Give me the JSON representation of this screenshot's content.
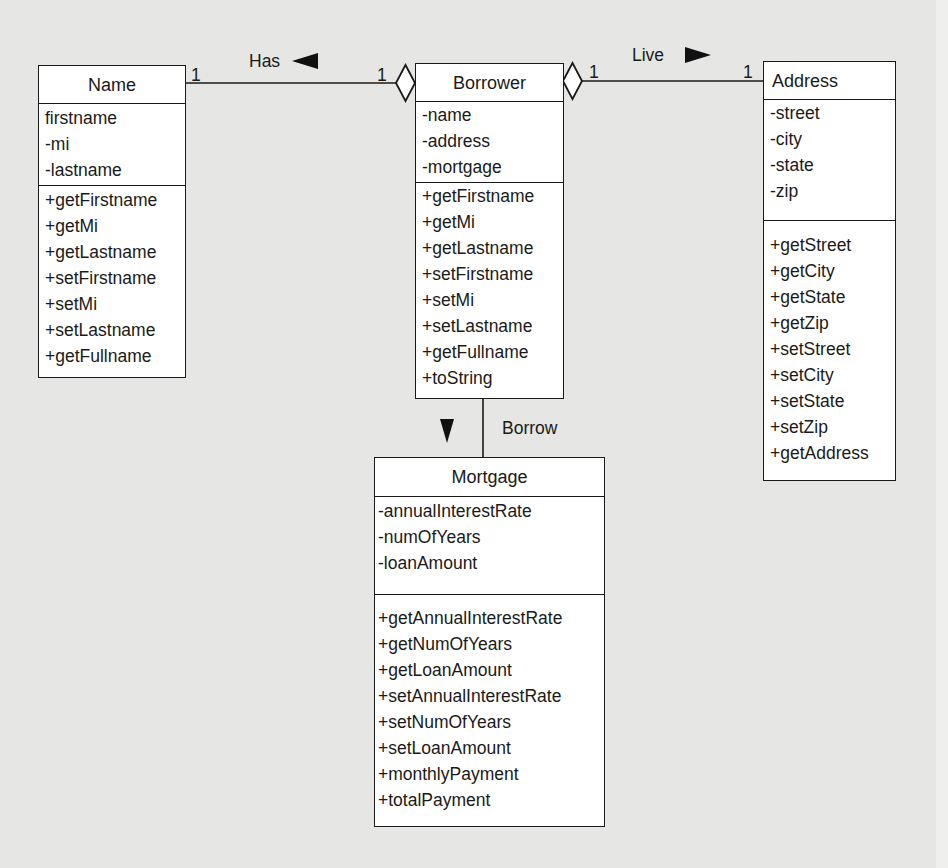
{
  "diagram": {
    "type": "UML class diagram",
    "background_color": "#e6e6e4",
    "classes": {
      "name": {
        "title": "Name",
        "attributes": [
          "firstname",
          "-mi",
          "-lastname"
        ],
        "methods": [
          "+getFirstname",
          "+getMi",
          "+getLastname",
          "+setFirstname",
          "+setMi",
          "+setLastname",
          "+getFullname"
        ]
      },
      "borrower": {
        "title": "Borrower",
        "attributes": [
          "-name",
          "-address",
          "-mortgage"
        ],
        "methods": [
          "+getFirstname",
          "+getMi",
          "+getLastname",
          "+setFirstname",
          "+setMi",
          "+setLastname",
          "+getFullname",
          "+toString"
        ]
      },
      "address": {
        "title": "Address",
        "attributes": [
          "-street",
          "-city",
          "-state",
          "-zip"
        ],
        "methods": [
          "+getStreet",
          "+getCity",
          "+getState",
          "+getZip",
          "+setStreet",
          "+setCity",
          "+setState",
          "+setZip",
          "+getAddress"
        ]
      },
      "mortgage": {
        "title": "Mortgage",
        "attributes": [
          "-annualInterestRate",
          "-numOfYears",
          "-loanAmount"
        ],
        "methods": [
          "+getAnnualInterestRate",
          "+getNumOfYears",
          "+getLoanAmount",
          "+setAnnualInterestRate",
          "+setNumOfYears",
          "+setLoanAmount",
          "+monthlyPayment",
          "+totalPayment"
        ]
      }
    },
    "associations": {
      "has": {
        "label": "Has",
        "direction_arrow": "◄",
        "from": "Borrower",
        "to": "Name",
        "multiplicity_name_end": "1",
        "multiplicity_borrower_end": "1",
        "aggregation_end": "Borrower"
      },
      "live": {
        "label": "Live",
        "direction_arrow": "►",
        "from": "Borrower",
        "to": "Address",
        "multiplicity_borrower_end": "1",
        "multiplicity_address_end": "1",
        "aggregation_end": "Borrower"
      },
      "borrow": {
        "label": "Borrow",
        "direction_arrow": "▼",
        "from": "Borrower",
        "to": "Mortgage"
      }
    }
  }
}
